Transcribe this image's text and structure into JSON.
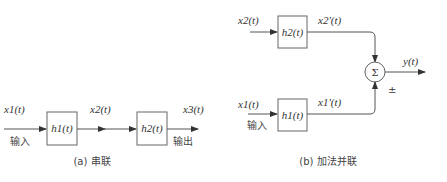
{
  "series": {
    "input_signal": "x1(t)",
    "input_label": "输入",
    "block1": "h1(t)",
    "intermediate_signal": "x2(t)",
    "block2": "h2(t)",
    "output_signal": "x3(t)",
    "output_label": "输出",
    "caption": "(a) 串联"
  },
  "parallel": {
    "top_input_signal": "x2(t)",
    "top_block": "h2(t)",
    "top_output_signal": "x2'(t)",
    "bottom_input_signal": "x1(t)",
    "bottom_input_label": "输入",
    "bottom_block": "h1(t)",
    "bottom_output_signal": "x1'(t)",
    "summer_symbol": "Σ",
    "sign_label": "±",
    "output_signal": "y(t)",
    "caption": "(b) 加法并联"
  }
}
